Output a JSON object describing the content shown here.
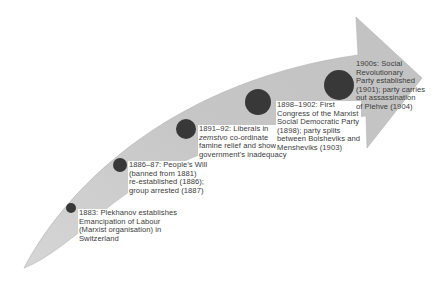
{
  "diagram": {
    "type": "timeline-arrow",
    "colors": {
      "arrow_fill": "#c9c9c9",
      "arrow_edge": "#b0b0b0",
      "marker": "#383838",
      "text": "#3b3b3b",
      "background": "#ffffff"
    },
    "events": [
      {
        "id": "e1",
        "date": "1883:",
        "lines": [
          "1883:  Plekhanov establishes",
          "Emancipation of Labour",
          "(Marxist organisation) in",
          "Switzerland"
        ],
        "marker": {
          "cx": 71,
          "cy": 208,
          "r": 5
        },
        "label_pos": {
          "x": 78,
          "y": 209
        }
      },
      {
        "id": "e2",
        "date": "1886–87:",
        "lines": [
          "1886–87: People’s Will",
          "(banned from 1881)",
          "re-established (1886);",
          "group arrested (1887)"
        ],
        "marker": {
          "cx": 120,
          "cy": 165,
          "r": 7
        },
        "label_pos": {
          "x": 128,
          "y": 161
        }
      },
      {
        "id": "e3",
        "date": "1891–92:",
        "lines": [
          "1891–92: Liberals in",
          "zemstvo co-ordinate",
          "famine relief and show",
          "government’s inadequacy"
        ],
        "italic_word": "zemstvo",
        "marker": {
          "cx": 186,
          "cy": 129,
          "r": 10
        },
        "label_pos": {
          "x": 198,
          "y": 125
        }
      },
      {
        "id": "e4",
        "date": "1898–1902:",
        "lines": [
          "1898–1902:  First",
          "Congress of the Marxist",
          "Social Democratic Party",
          "(1898); party splits",
          "between Bolsheviks and",
          "Mensheviks (1903)"
        ],
        "marker": {
          "cx": 258,
          "cy": 102,
          "r": 13
        },
        "label_pos": {
          "x": 276,
          "y": 101
        }
      },
      {
        "id": "e5",
        "date": "1900s:",
        "lines": [
          "1900s:  Social",
          "Revolutionary",
          "Party established",
          "(1901); party carries",
          "out assassination",
          "of Plehve (1904)"
        ],
        "marker": {
          "cx": 339,
          "cy": 85,
          "r": 15
        },
        "label_pos": {
          "x": 355,
          "y": 60
        }
      }
    ]
  }
}
